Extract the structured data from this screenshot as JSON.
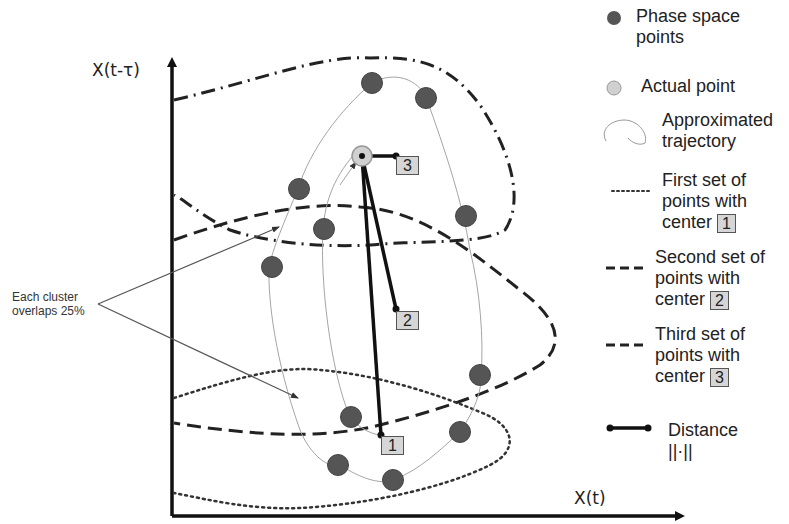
{
  "axes": {
    "x_label": "X(t)",
    "y_label": "X(t-τ)"
  },
  "annotation": {
    "line1": "Each cluster",
    "line2": "overlaps 25%"
  },
  "center_labels": {
    "c1": "1",
    "c2": "2",
    "c3": "3"
  },
  "legend": {
    "phase_points": {
      "line1": "Phase space",
      "line2": "points"
    },
    "actual_point": {
      "line1": "Actual point"
    },
    "trajectory": {
      "line1": "Approximated",
      "line2": "trajectory"
    },
    "first_set": {
      "line1": "First set of",
      "line2": "points with",
      "line3": "center",
      "badge": "1"
    },
    "second_set": {
      "line1": "Second set of",
      "line2": "points with",
      "line3": "center",
      "badge": "2"
    },
    "third_set": {
      "line1": "Third set of",
      "line2": "points with",
      "line3": "center",
      "badge": "3"
    },
    "distance": {
      "line1": "Distance",
      "line2": "||·||"
    }
  },
  "colors": {
    "point_fill": "#555555",
    "actual_point_fill": "#d0d0d0",
    "badge_fill": "#d6d6d6",
    "axis": "#111111",
    "trajectory": "#9a9a9a"
  }
}
